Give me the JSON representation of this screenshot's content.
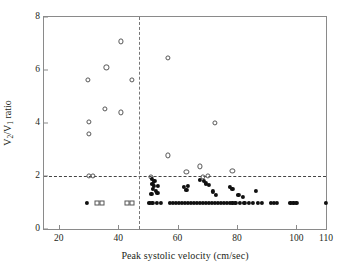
{
  "chart_data": {
    "type": "scatter",
    "title": "",
    "xlabel": "Peak systolic velocity (cm/sec)",
    "ylabel": "V2/V1 ratio",
    "ylabel_parts": {
      "v": "V",
      "sub2": "2",
      "slash": "/V",
      "sub1": "1",
      "tail": " ratio"
    },
    "xlim": [
      15,
      110
    ],
    "ylim": [
      0,
      8
    ],
    "xticks": [
      20,
      40,
      60,
      80,
      100,
      110
    ],
    "yticks": [
      0,
      2,
      4,
      6,
      8
    ],
    "grid": false,
    "legend": "none",
    "annotations": [
      {
        "name": "ratio-threshold-line",
        "type": "hline",
        "y": 2,
        "style": "dashed"
      },
      {
        "name": "velocity-threshold-line",
        "type": "vline",
        "x": 47,
        "style": "dashed"
      }
    ],
    "series": [
      {
        "name": "open-circles",
        "marker": "open-circle",
        "points": [
          [
            29.8,
            5.62
          ],
          [
            36.0,
            6.1
          ],
          [
            40.8,
            7.08
          ],
          [
            44.6,
            5.62
          ],
          [
            30.2,
            4.03
          ],
          [
            30.2,
            3.6
          ],
          [
            35.5,
            4.52
          ],
          [
            41.0,
            4.4
          ],
          [
            56.8,
            6.45
          ],
          [
            72.5,
            4.0
          ],
          [
            56.8,
            2.78
          ],
          [
            63.0,
            2.15
          ],
          [
            67.5,
            2.36
          ],
          [
            78.5,
            2.18
          ],
          [
            30.0,
            2.0
          ],
          [
            31.5,
            2.0
          ],
          [
            51.0,
            1.98
          ],
          [
            68.5,
            1.97
          ],
          [
            70.3,
            2.0
          ]
        ]
      },
      {
        "name": "filled-circles",
        "marker": "filled-circle",
        "points": [
          [
            51.3,
            1.88
          ],
          [
            52.2,
            1.83
          ],
          [
            51.5,
            1.7
          ],
          [
            52.0,
            1.62
          ],
          [
            53.5,
            1.63
          ],
          [
            51.8,
            1.52
          ],
          [
            52.8,
            1.43
          ],
          [
            53.2,
            1.35
          ],
          [
            51.2,
            1.32
          ],
          [
            62.0,
            1.6
          ],
          [
            63.5,
            1.62
          ],
          [
            63.0,
            1.48
          ],
          [
            67.5,
            1.85
          ],
          [
            68.8,
            1.8
          ],
          [
            69.5,
            1.72
          ],
          [
            70.5,
            1.66
          ],
          [
            72.0,
            1.42
          ],
          [
            73.0,
            1.3
          ],
          [
            77.5,
            1.58
          ],
          [
            78.5,
            1.52
          ],
          [
            80.5,
            1.3
          ],
          [
            82.0,
            1.22
          ],
          [
            86.5,
            1.45
          ],
          [
            29.5,
            1.0
          ],
          [
            50.5,
            1.0
          ],
          [
            51.5,
            1.0
          ],
          [
            53.0,
            1.0
          ],
          [
            54.5,
            1.0
          ],
          [
            57.5,
            1.0
          ],
          [
            58.5,
            1.0
          ],
          [
            59.5,
            1.0
          ],
          [
            60.5,
            1.0
          ],
          [
            61.5,
            1.0
          ],
          [
            62.5,
            1.0
          ],
          [
            63.5,
            1.0
          ],
          [
            64.5,
            1.0
          ],
          [
            65.5,
            1.0
          ],
          [
            66.5,
            1.0
          ],
          [
            67.5,
            1.0
          ],
          [
            68.5,
            1.0
          ],
          [
            69.5,
            1.0
          ],
          [
            70.5,
            1.0
          ],
          [
            71.5,
            1.0
          ],
          [
            72.5,
            1.0
          ],
          [
            73.5,
            1.0
          ],
          [
            74.5,
            1.0
          ],
          [
            75.5,
            1.0
          ],
          [
            76.5,
            1.0
          ],
          [
            77.5,
            1.0
          ],
          [
            78.5,
            1.0
          ],
          [
            79.5,
            1.0
          ],
          [
            81.0,
            1.0
          ],
          [
            82.5,
            1.0
          ],
          [
            84.0,
            1.0
          ],
          [
            85.5,
            1.0
          ],
          [
            87.0,
            1.0
          ],
          [
            88.5,
            1.0
          ],
          [
            91.5,
            1.0
          ],
          [
            92.5,
            1.0
          ],
          [
            93.5,
            1.0
          ],
          [
            98.0,
            1.0
          ],
          [
            99.0,
            1.0
          ],
          [
            100.0,
            1.0
          ],
          [
            110.0,
            1.0
          ]
        ]
      },
      {
        "name": "open-squares",
        "marker": "open-square",
        "points": [
          [
            32.8,
            1.0
          ],
          [
            34.5,
            1.0
          ],
          [
            43.0,
            1.0
          ],
          [
            44.7,
            1.0
          ]
        ]
      }
    ]
  },
  "axes": {
    "x_tick_labels": [
      "20",
      "40",
      "60",
      "80",
      "100",
      "110"
    ],
    "y_tick_labels": [
      "0",
      "2",
      "4",
      "6",
      "8"
    ]
  },
  "colors": {
    "frame": "#8a8a8a",
    "marker_fill": "#101010",
    "marker_open_stroke": "#555555",
    "dash_line": "#444444",
    "text": "#231f20",
    "background": "#ffffff"
  }
}
